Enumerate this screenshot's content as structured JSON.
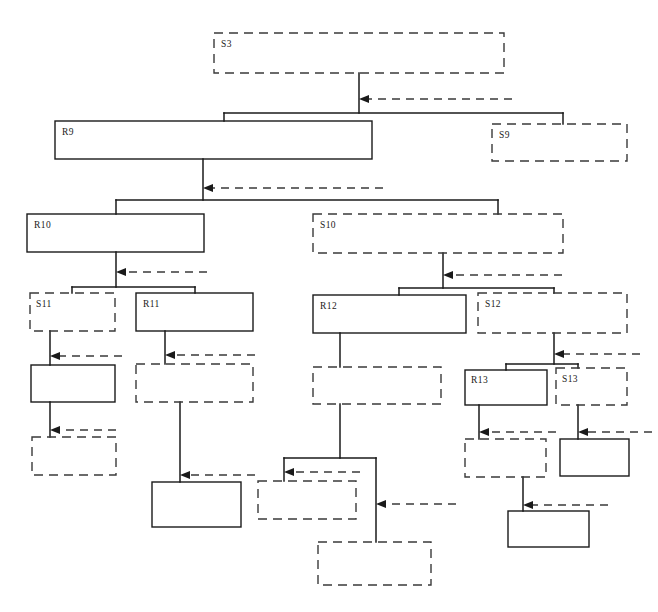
{
  "diagram": {
    "title": "",
    "type": "hierarchical-refinement-tree",
    "canvas": {
      "width": 658,
      "height": 612,
      "background": "#ffffff"
    },
    "styles": {
      "solid_stroke": "#1a1a1a",
      "dashed_stroke": "#3a3a3a",
      "box_fill": "#ffffff",
      "dash_pattern": "9 6"
    },
    "nodes": [
      {
        "id": "S3",
        "label": "S3",
        "style": "dashed",
        "x": 214,
        "y": 33,
        "w": 290,
        "h": 40
      },
      {
        "id": "R9",
        "label": "R9",
        "style": "solid",
        "x": 55,
        "y": 121,
        "w": 317,
        "h": 38
      },
      {
        "id": "S9",
        "label": "S9",
        "style": "dashed",
        "x": 492,
        "y": 124,
        "w": 135,
        "h": 37
      },
      {
        "id": "R10",
        "label": "R10",
        "style": "solid",
        "x": 27,
        "y": 214,
        "w": 177,
        "h": 38
      },
      {
        "id": "S10",
        "label": "S10",
        "style": "dashed",
        "x": 313,
        "y": 214,
        "w": 250,
        "h": 39
      },
      {
        "id": "S11",
        "label": "S11",
        "style": "dashed",
        "x": 30,
        "y": 293,
        "w": 85,
        "h": 38
      },
      {
        "id": "R11",
        "label": "R11",
        "style": "solid",
        "x": 136,
        "y": 293,
        "w": 117,
        "h": 38
      },
      {
        "id": "R12",
        "label": "R12",
        "style": "solid",
        "x": 313,
        "y": 295,
        "w": 153,
        "h": 38
      },
      {
        "id": "S12",
        "label": "S12",
        "style": "dashed",
        "x": 478,
        "y": 293,
        "w": 149,
        "h": 40
      },
      {
        "id": "N1",
        "label": "",
        "style": "solid",
        "x": 31,
        "y": 365,
        "w": 84,
        "h": 37
      },
      {
        "id": "N2",
        "label": "",
        "style": "dashed",
        "x": 136,
        "y": 364,
        "w": 117,
        "h": 38
      },
      {
        "id": "N3",
        "label": "",
        "style": "dashed",
        "x": 313,
        "y": 367,
        "w": 128,
        "h": 37
      },
      {
        "id": "R13",
        "label": "R13",
        "style": "solid",
        "x": 465,
        "y": 370,
        "w": 82,
        "h": 35
      },
      {
        "id": "S13",
        "label": "S13",
        "style": "dashed",
        "x": 556,
        "y": 368,
        "w": 71,
        "h": 37
      },
      {
        "id": "N4",
        "label": "",
        "style": "dashed",
        "x": 32,
        "y": 437,
        "w": 84,
        "h": 38
      },
      {
        "id": "N5",
        "label": "",
        "style": "dashed",
        "x": 465,
        "y": 439,
        "w": 81,
        "h": 38
      },
      {
        "id": "N6",
        "label": "",
        "style": "solid",
        "x": 560,
        "y": 439,
        "w": 69,
        "h": 37
      },
      {
        "id": "N7",
        "label": "",
        "style": "dashed",
        "x": 258,
        "y": 481,
        "w": 98,
        "h": 38
      },
      {
        "id": "N8",
        "label": "",
        "style": "solid",
        "x": 152,
        "y": 482,
        "w": 89,
        "h": 45
      },
      {
        "id": "N9",
        "label": "",
        "style": "solid",
        "x": 508,
        "y": 511,
        "w": 81,
        "h": 36
      },
      {
        "id": "N10",
        "label": "",
        "style": "dashed",
        "x": 318,
        "y": 542,
        "w": 113,
        "h": 43
      }
    ],
    "arrows": [
      {
        "from": "S3-subtree",
        "to_x": 359,
        "to_y": 99,
        "from_x": 512,
        "style": "dashed"
      },
      {
        "from": "R9-subtree",
        "to_x": 203,
        "to_y": 188,
        "from_x": 383,
        "style": "dashed"
      },
      {
        "from": "R10-subtree",
        "to_x": 116,
        "to_y": 272,
        "from_x": 207,
        "style": "dashed"
      },
      {
        "from": "S10-subtree",
        "to_x": 443,
        "to_y": 275,
        "from_x": 562,
        "style": "dashed"
      },
      {
        "from": "S11-child",
        "to_x": 50,
        "to_y": 356,
        "from_x": 122,
        "style": "dashed"
      },
      {
        "from": "R11-child",
        "to_x": 165,
        "to_y": 355,
        "from_x": 255,
        "style": "dashed"
      },
      {
        "from": "S12-child",
        "to_x": 554,
        "to_y": 354,
        "from_x": 636,
        "style": "dashed"
      },
      {
        "from": "N1-child",
        "to_x": 50,
        "to_y": 430,
        "from_x": 116,
        "style": "dashed"
      },
      {
        "from": "R13-child",
        "to_x": 479,
        "to_y": 432,
        "from_x": 556,
        "style": "dashed"
      },
      {
        "from": "S13-child",
        "to_x": 578,
        "to_y": 432,
        "from_x": 648,
        "style": "dashed"
      },
      {
        "from": "R12-branch",
        "to_x": 284,
        "to_y": 472,
        "from_x": 360,
        "style": "dashed"
      },
      {
        "from": "N2-child",
        "to_x": 180,
        "to_y": 475,
        "from_x": 255,
        "style": "dashed"
      },
      {
        "from": "R12-right",
        "to_x": 376,
        "to_y": 504,
        "from_x": 456,
        "style": "dashed"
      },
      {
        "from": "N5-child",
        "to_x": 523,
        "to_y": 505,
        "from_x": 600,
        "style": "dashed"
      }
    ]
  }
}
